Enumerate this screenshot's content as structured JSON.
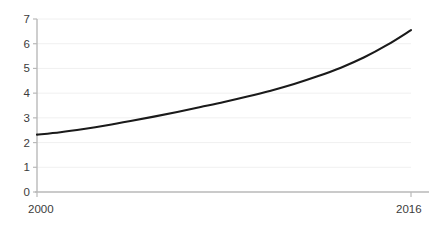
{
  "chart_data": {
    "type": "line",
    "title": "",
    "subtitle": "",
    "xlabel": "",
    "ylabel": "",
    "xlim": [
      2000,
      2016
    ],
    "ylim": [
      0,
      7
    ],
    "grid": true,
    "legend": false,
    "legend_position": "none",
    "line_color": "#1a1a1a",
    "axis_color": "#b9b9b9",
    "grid_color": "#f0f0f0",
    "label_color": "#3b3b3b",
    "y_ticks": [
      0,
      1,
      2,
      3,
      4,
      5,
      6,
      7
    ],
    "y_tick_labels": [
      "0",
      "1",
      "2",
      "3",
      "4",
      "5",
      "6",
      "7"
    ],
    "x_ticks": [
      2000,
      2016
    ],
    "x_tick_labels": [
      "2000",
      "2016"
    ],
    "x": [
      2000,
      2001,
      2002,
      2003,
      2004,
      2005,
      2006,
      2007,
      2008,
      2009,
      2010,
      2011,
      2012,
      2013,
      2014,
      2015,
      2016
    ],
    "series": [
      {
        "name": "value",
        "values": [
          2.32,
          2.42,
          2.55,
          2.7,
          2.87,
          3.05,
          3.24,
          3.44,
          3.64,
          3.86,
          4.1,
          4.37,
          4.68,
          5.03,
          5.45,
          5.96,
          6.55
        ]
      }
    ]
  }
}
